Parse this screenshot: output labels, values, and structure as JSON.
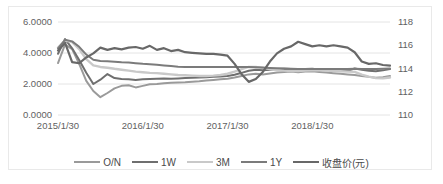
{
  "chart_data": {
    "type": "line",
    "title": "",
    "xlabel": "",
    "ylabel": "",
    "grid": true,
    "legend_position": "bottom",
    "x_tick_labels": [
      "2015/1/30",
      "2016/1/30",
      "2017/1/30",
      "2018/1/30"
    ],
    "x_tick_indices": [
      0,
      12,
      24,
      36
    ],
    "x_count": 48,
    "left_axis": {
      "label": "",
      "ylim": [
        0.0,
        6.0
      ],
      "ticks": [
        0.0,
        2.0,
        4.0,
        6.0
      ],
      "tick_labels": [
        "0.0000",
        "2.0000",
        "4.0000",
        "6.0000"
      ]
    },
    "right_axis": {
      "label": "",
      "ylim": [
        110,
        118
      ],
      "ticks": [
        110,
        112,
        114,
        116,
        118
      ],
      "tick_labels": [
        "110",
        "112",
        "114",
        "116",
        "118"
      ]
    },
    "series": [
      {
        "name": "O/N",
        "axis": "left",
        "color": "#9a9a9a",
        "width": 2.0,
        "values": [
          3.35,
          4.55,
          4.25,
          3.3,
          2.2,
          1.55,
          1.15,
          1.42,
          1.72,
          1.88,
          1.92,
          1.78,
          1.88,
          1.98,
          2.0,
          2.05,
          2.08,
          2.1,
          2.12,
          2.15,
          2.18,
          2.22,
          2.26,
          2.3,
          2.34,
          2.42,
          2.52,
          2.62,
          2.66,
          2.62,
          2.68,
          2.74,
          2.78,
          2.8,
          2.76,
          2.8,
          2.82,
          2.78,
          2.74,
          2.7,
          2.66,
          2.62,
          2.58,
          2.52,
          2.46,
          2.4,
          2.44,
          2.52
        ]
      },
      {
        "name": "1W",
        "axis": "left",
        "color": "#6f6f6f",
        "width": 2.0,
        "values": [
          3.95,
          4.9,
          4.3,
          3.55,
          2.72,
          2.0,
          2.28,
          2.64,
          2.38,
          2.32,
          2.3,
          2.26,
          2.3,
          2.32,
          2.34,
          2.36,
          2.34,
          2.36,
          2.38,
          2.4,
          2.42,
          2.44,
          2.46,
          2.48,
          2.52,
          2.6,
          2.72,
          2.86,
          2.92,
          2.88,
          2.92,
          2.96,
          2.98,
          2.96,
          2.92,
          2.96,
          2.98,
          2.94,
          2.92,
          2.9,
          2.88,
          2.86,
          3.0,
          2.92,
          2.86,
          2.82,
          2.88,
          2.96
        ]
      },
      {
        "name": "3M",
        "axis": "left",
        "color": "#c9c9c9",
        "width": 2.4,
        "values": [
          4.35,
          4.8,
          4.7,
          4.25,
          3.6,
          3.2,
          3.1,
          3.05,
          2.98,
          2.92,
          2.86,
          2.8,
          2.76,
          2.72,
          2.7,
          2.66,
          2.62,
          2.58,
          2.56,
          2.54,
          2.52,
          2.52,
          2.54,
          2.58,
          2.66,
          2.8,
          2.96,
          3.1,
          3.1,
          3.04,
          2.96,
          2.9,
          2.86,
          2.84,
          2.84,
          2.86,
          2.88,
          2.88,
          2.86,
          2.84,
          2.82,
          2.8,
          2.78,
          2.6,
          2.48,
          2.38,
          2.36,
          2.42
        ]
      },
      {
        "name": "1Y",
        "axis": "left",
        "color": "#7b7b7b",
        "width": 2.0,
        "values": [
          4.3,
          4.85,
          4.75,
          4.4,
          3.9,
          3.56,
          3.48,
          3.46,
          3.44,
          3.4,
          3.38,
          3.34,
          3.3,
          3.28,
          3.24,
          3.2,
          3.16,
          3.12,
          3.1,
          3.1,
          3.1,
          3.1,
          3.1,
          3.1,
          3.1,
          3.1,
          3.1,
          3.1,
          3.08,
          3.06,
          3.04,
          3.02,
          3.0,
          2.98,
          2.96,
          2.96,
          2.96,
          2.96,
          2.96,
          2.96,
          2.96,
          2.96,
          2.98,
          2.96,
          2.96,
          2.96,
          2.98,
          3.0
        ]
      },
      {
        "name": "收盘价(元)",
        "axis": "right",
        "color": "#686868",
        "width": 2.2,
        "values": [
          115.55,
          116.2,
          114.55,
          114.45,
          114.95,
          115.3,
          115.8,
          115.6,
          115.75,
          115.65,
          115.8,
          115.85,
          115.7,
          115.95,
          115.6,
          115.75,
          115.5,
          115.6,
          115.4,
          115.35,
          115.3,
          115.25,
          115.25,
          115.2,
          115.1,
          114.4,
          113.5,
          112.85,
          113.1,
          113.7,
          114.6,
          115.3,
          115.7,
          115.9,
          116.3,
          116.1,
          115.9,
          116.0,
          115.9,
          116.0,
          115.9,
          115.8,
          115.4,
          114.6,
          114.4,
          114.45,
          114.3,
          114.25
        ]
      }
    ]
  },
  "legend": {
    "items": [
      {
        "label": "O/N"
      },
      {
        "label": "1W"
      },
      {
        "label": "3M"
      },
      {
        "label": "1Y"
      },
      {
        "label": "收盘价(元)"
      }
    ]
  }
}
